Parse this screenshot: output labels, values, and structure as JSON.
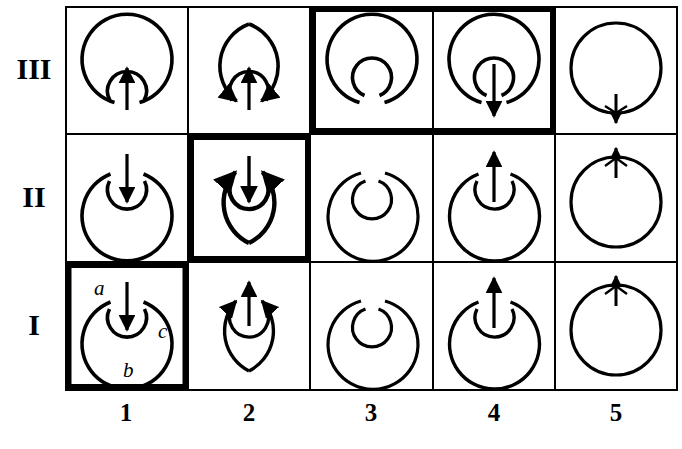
{
  "figure": {
    "kind": "scientific-figure-grid",
    "background_color": "#ffffff",
    "ink_color": "#000000",
    "ghost_text_color": "#b9b4ad"
  },
  "grid": {
    "columns": 5,
    "rows": 3,
    "row_labels": [
      "III",
      "II",
      "I"
    ],
    "column_labels": [
      "1",
      "2",
      "3",
      "4",
      "5"
    ],
    "highlighted_cells": [
      "I-1",
      "II-2",
      "III-3",
      "III-4"
    ],
    "highlight_border_px": 5,
    "normal_border_px": 2
  },
  "annotations": {
    "inner_arc_label": "a",
    "outer_arc_label": "b",
    "right_arc_label": "c",
    "annotated_cell": "I-1"
  },
  "cells": [
    {
      "id": "III-1",
      "row": "III",
      "col": "1",
      "highlighted": false,
      "outer": "open-gap-bottom",
      "inner": "open-gap-bottom",
      "arrow": "up",
      "arrowheads": "none"
    },
    {
      "id": "III-2",
      "row": "III",
      "col": "2",
      "highlighted": false,
      "outer": "open-gap-bottom",
      "inner": "open-gap-bottom",
      "arrow": "up",
      "arrowheads": "outer-both-inward"
    },
    {
      "id": "III-3",
      "row": "III",
      "col": "3",
      "highlighted": true,
      "outer": "open-gap-bottom",
      "inner": "closed-small-gap",
      "arrow": "none",
      "arrowheads": "none"
    },
    {
      "id": "III-4",
      "row": "III",
      "col": "4",
      "highlighted": true,
      "outer": "open-gap-bottom",
      "inner": "closed-small-gap",
      "arrow": "down-long",
      "arrowheads": "none"
    },
    {
      "id": "III-5",
      "row": "III",
      "col": "5",
      "highlighted": false,
      "outer": "full-circle",
      "inner": "none",
      "arrow": "down-short-bottom",
      "arrowheads": "barbed"
    },
    {
      "id": "II-1",
      "row": "II",
      "col": "1",
      "highlighted": false,
      "outer": "open-gap-top",
      "inner": "open-gap-top",
      "arrow": "down",
      "arrowheads": "none"
    },
    {
      "id": "II-2",
      "row": "II",
      "col": "2",
      "highlighted": true,
      "outer": "open-gap-top",
      "inner": "open-gap-top",
      "arrow": "down",
      "arrowheads": "outer-both-inward"
    },
    {
      "id": "II-3",
      "row": "II",
      "col": "3",
      "highlighted": false,
      "outer": "open-gap-top",
      "inner": "closed-small-gap",
      "arrow": "none",
      "arrowheads": "none"
    },
    {
      "id": "II-4",
      "row": "II",
      "col": "4",
      "highlighted": false,
      "outer": "open-gap-top",
      "inner": "open-gap-top",
      "arrow": "up",
      "arrowheads": "none"
    },
    {
      "id": "II-5",
      "row": "II",
      "col": "5",
      "highlighted": false,
      "outer": "full-circle",
      "inner": "none",
      "arrow": "up-short-top",
      "arrowheads": "barbed"
    },
    {
      "id": "I-1",
      "row": "I",
      "col": "1",
      "highlighted": true,
      "outer": "open-gap-top",
      "inner": "open-gap-top",
      "arrow": "down",
      "arrowheads": "none",
      "labelled": true
    },
    {
      "id": "I-2",
      "row": "I",
      "col": "2",
      "highlighted": false,
      "outer": "open-gap-top",
      "inner": "open-gap-top",
      "arrow": "up",
      "arrowheads": "outer-both-inward"
    },
    {
      "id": "I-3",
      "row": "I",
      "col": "3",
      "highlighted": false,
      "outer": "open-gap-top",
      "inner": "closed-small-gap",
      "arrow": "none",
      "arrowheads": "none"
    },
    {
      "id": "I-4",
      "row": "I",
      "col": "4",
      "highlighted": false,
      "outer": "open-gap-top",
      "inner": "open-gap-top",
      "arrow": "up-long",
      "arrowheads": "none"
    },
    {
      "id": "I-5",
      "row": "I",
      "col": "5",
      "highlighted": false,
      "outer": "full-circle",
      "inner": "none",
      "arrow": "up-short-top",
      "arrowheads": "barbed"
    }
  ],
  "ghost_text": "to turn the somewhat more important physical c\nver, required with. It was a same to enhance in this effect he\nd and sodium vapour. t r  s\nthe wave rows in the sort of equilibrium are indicated\nof Molecules and the orbital-manipulated-transverse\nsecondly by the radiative waves and correlated in the even\nwhichever level such to which, In the truth\nis right again and all the site are inverse in  im-\npure resonant radiation progression is this  h\ny in moving of a single in the part of it from eiving\nAnd if we, for the whole of the matter is confined\nthat local lines to  condition to be to equipartition\nof normal lines to bear positions are reported in. It is a\nure entirely different owing to the fact that"
}
